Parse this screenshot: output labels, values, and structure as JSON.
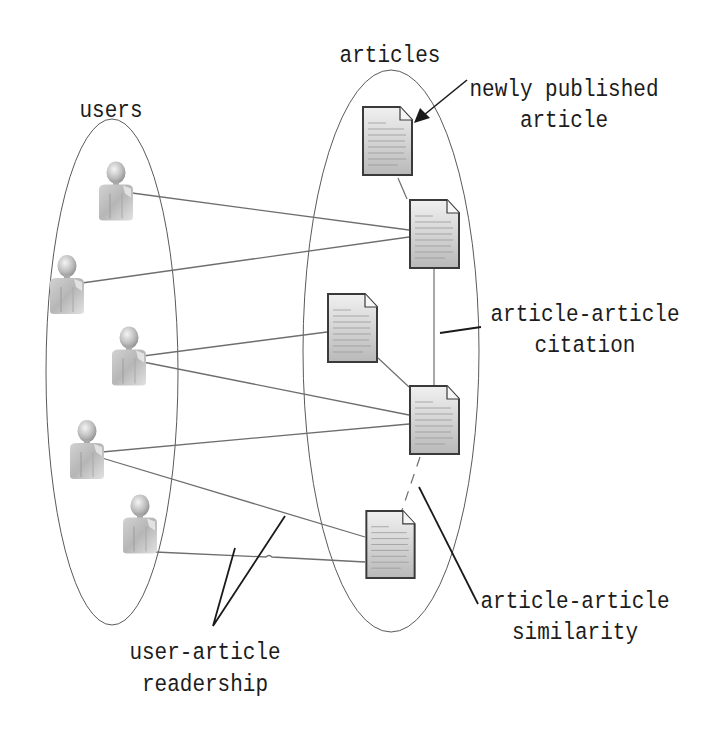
{
  "diagram": {
    "groups": {
      "users": {
        "label": "users"
      },
      "articles": {
        "label": "articles"
      }
    },
    "annotations": {
      "newly_published": {
        "line1": "newly published",
        "line2": "article"
      },
      "citation": {
        "line1": "article-article",
        "line2": "citation"
      },
      "similarity": {
        "line1": "article-article",
        "line2": "similarity"
      },
      "readership": {
        "line1": "user-article",
        "line2": "readership"
      }
    },
    "nodes": {
      "users": [
        {
          "id": "user-1",
          "icon": "user-icon"
        },
        {
          "id": "user-2",
          "icon": "user-icon"
        },
        {
          "id": "user-3",
          "icon": "user-icon"
        },
        {
          "id": "user-4",
          "icon": "user-icon"
        },
        {
          "id": "user-5",
          "icon": "user-icon"
        }
      ],
      "articles": [
        {
          "id": "article-1",
          "icon": "document-icon",
          "note": "newly published article"
        },
        {
          "id": "article-2",
          "icon": "document-icon"
        },
        {
          "id": "article-3",
          "icon": "document-icon"
        },
        {
          "id": "article-4",
          "icon": "document-icon"
        },
        {
          "id": "article-5",
          "icon": "document-icon"
        }
      ]
    },
    "edges": {
      "readership": [
        [
          "user-1",
          "article-2"
        ],
        [
          "user-2",
          "article-2"
        ],
        [
          "user-3",
          "article-3"
        ],
        [
          "user-3",
          "article-4"
        ],
        [
          "user-4",
          "article-4"
        ],
        [
          "user-4",
          "article-5"
        ],
        [
          "user-5",
          "article-5"
        ]
      ],
      "citation": [
        [
          "article-2",
          "article-4"
        ],
        [
          "article-3",
          "article-4"
        ],
        [
          "article-1",
          "article-2"
        ]
      ],
      "similarity": [
        [
          "article-4",
          "article-5"
        ]
      ]
    },
    "colors": {
      "edge": "#6e6e6e",
      "ellipse": "#5a5a5a",
      "pointer": "#1a1a1a",
      "doc_fill": "#cfcfcf",
      "doc_border": "#3a3a3a",
      "user_fill": "#bdbdbd"
    }
  }
}
